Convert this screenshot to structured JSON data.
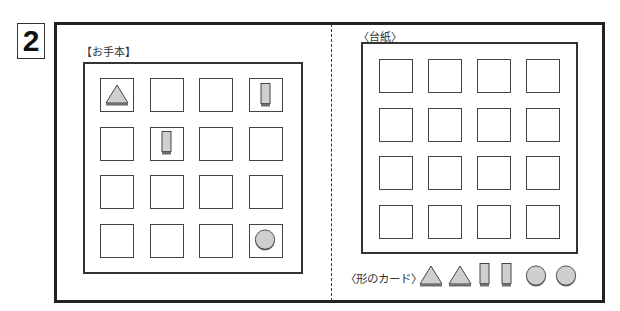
{
  "question_number": "2",
  "model_panel": {
    "label": "【お手本】",
    "rows": 4,
    "cols": 4,
    "cells": [
      [
        "triangle",
        "",
        "",
        "rectangle"
      ],
      [
        "",
        "rectangle",
        "",
        ""
      ],
      [
        "",
        "",
        "",
        ""
      ],
      [
        "",
        "",
        "",
        "circle"
      ]
    ]
  },
  "board_panel": {
    "label": "〈台紙〉",
    "rows": 4,
    "cols": 4
  },
  "cards": {
    "label": "〈形のカード〉",
    "items": [
      "triangle",
      "triangle",
      "rectangle",
      "rectangle",
      "circle",
      "circle"
    ]
  },
  "colors": {
    "shape_fill": "#cfcfcf",
    "shape_shadow": "#6e6e6e",
    "line": "#333333"
  }
}
